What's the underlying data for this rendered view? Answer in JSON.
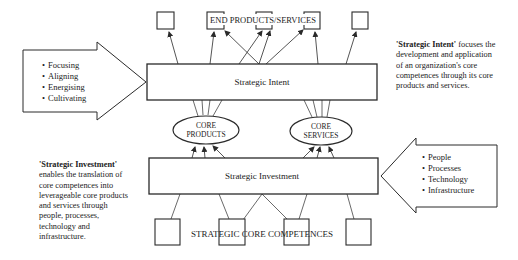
{
  "diagram": {
    "top_label": "END PRODUCTS/SERVICES",
    "bottom_label": "STRATEGIC CORE COMPETENCES",
    "intent_box": "Strategic Intent",
    "investment_box": "Strategic Investment",
    "core_products": {
      "line1": "CORE",
      "line2": "PRODUCTS"
    },
    "core_services": {
      "line1": "CORE",
      "line2": "SERVICES"
    },
    "left_arrow_items": [
      "Focusing",
      "Aligning",
      "Energising",
      "Cultivating"
    ],
    "right_arrow_items": [
      "People",
      "Processes",
      "Technology",
      "Infrastructure"
    ],
    "intent_description": {
      "term": "'Strategic Intent'",
      "text": " focuses the development and application of an organization's core competences through its core products and services."
    },
    "investment_description": {
      "term": "'Strategic Investment'",
      "text": " enables the translation of core competences into leverageable core products and services through people, processes, technology and infrastructure."
    },
    "colors": {
      "line": "#2a2a2a",
      "background": "#ffffff"
    }
  }
}
